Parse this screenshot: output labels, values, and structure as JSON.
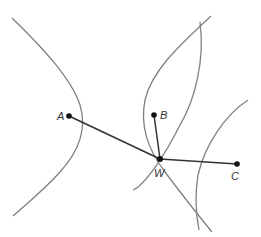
{
  "diagram": {
    "points": [
      {
        "label": "A",
        "x": 69,
        "y": 116
      },
      {
        "label": "B",
        "x": 154,
        "y": 115
      },
      {
        "label": "W",
        "x": 160,
        "y": 159
      },
      {
        "label": "C",
        "x": 237,
        "y": 164
      }
    ],
    "segments": [
      "AW",
      "BW",
      "CW"
    ],
    "colors": {
      "curve": "#808080",
      "segment": "#333333",
      "point": "#111111"
    }
  }
}
